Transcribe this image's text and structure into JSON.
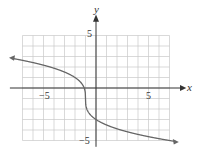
{
  "chart_data": {
    "type": "line",
    "title": "",
    "xlabel": "x",
    "ylabel": "y",
    "xlim": [
      -7,
      7
    ],
    "ylim": [
      -5,
      5
    ],
    "grid": true,
    "x_ticks_labeled": [
      "-5",
      "5"
    ],
    "y_ticks_labeled": [
      "5",
      "-5"
    ],
    "series": [
      {
        "name": "f(x) = -2∛(x+1) - 1",
        "x": [
          -8,
          -7,
          -5,
          -3,
          -2,
          -1.5,
          -1,
          -0.5,
          0,
          1,
          3,
          5,
          7,
          7.7
        ],
        "y": [
          2.83,
          2.63,
          2.17,
          1.52,
          1.0,
          0.59,
          -1.0,
          -2.59,
          -3.0,
          -3.52,
          -4.17,
          -4.63,
          -5.0,
          -5.14
        ]
      }
    ],
    "annotations": [
      "arrows at both ends of the curve"
    ]
  },
  "labels": {
    "x_axis": "x",
    "y_axis": "y",
    "x_neg5": "−5",
    "x_pos5": "5",
    "y_pos5": "5",
    "y_neg5": "−5"
  },
  "colors": {
    "grid": "#c8c8c8",
    "axis": "#333333",
    "curve": "#666666"
  }
}
